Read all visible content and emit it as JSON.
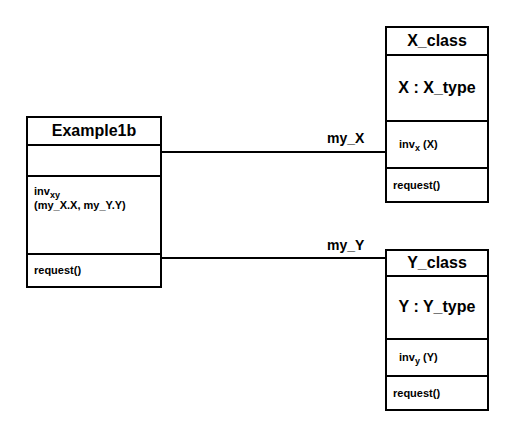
{
  "diagram": {
    "kind": "uml-class-diagram",
    "background_color": "#ffffff",
    "line_color": "#000000"
  },
  "classes": {
    "example1b": {
      "name": "Example1b",
      "attribute": "",
      "invariant_name": "inv",
      "invariant_subscript": "xy",
      "invariant_args": "(my_X.X, my_Y.Y)",
      "operation": "request()"
    },
    "x_class": {
      "name": "X_class",
      "attribute": "X : X_type",
      "invariant_name": "inv",
      "invariant_subscript": "x",
      "invariant_args": " (X)",
      "operation": "request()"
    },
    "y_class": {
      "name": "Y_class",
      "attribute": "Y : Y_type",
      "invariant_name": "inv",
      "invariant_subscript": "y",
      "invariant_args": " (Y)",
      "operation": "request()"
    }
  },
  "associations": {
    "my_x": {
      "label": "my_X"
    },
    "my_y": {
      "label": "my_Y"
    }
  }
}
